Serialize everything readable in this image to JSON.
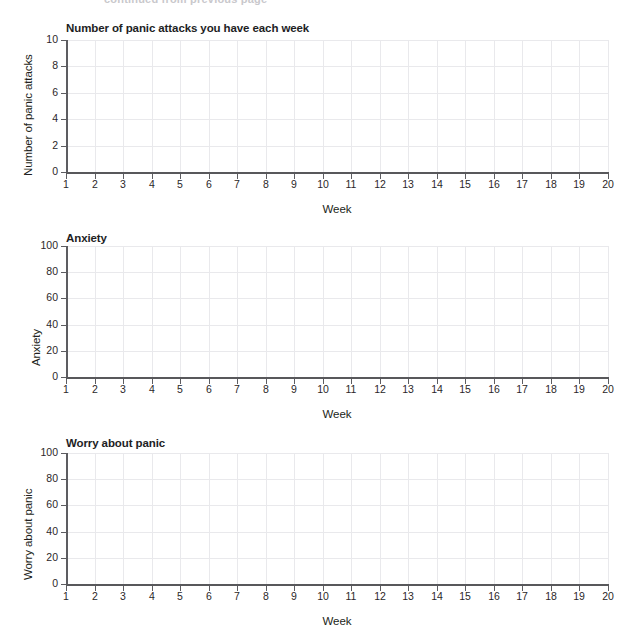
{
  "page": {
    "clipped_header_text": "continued from previous page"
  },
  "charts": [
    {
      "title": "Number of panic attacks you have each week",
      "ylabel": "Number of panic attacks",
      "xlabel": "Week",
      "yticks": [
        "0",
        "2",
        "4",
        "6",
        "8",
        "10"
      ],
      "xticks": [
        "1",
        "2",
        "3",
        "4",
        "5",
        "6",
        "7",
        "8",
        "9",
        "10",
        "11",
        "12",
        "13",
        "14",
        "15",
        "16",
        "17",
        "18",
        "19",
        "20"
      ]
    },
    {
      "title": "Anxiety",
      "ylabel": "Anxiety",
      "xlabel": "Week",
      "yticks": [
        "0",
        "20",
        "40",
        "60",
        "80",
        "100"
      ],
      "xticks": [
        "1",
        "2",
        "3",
        "4",
        "5",
        "6",
        "7",
        "8",
        "9",
        "10",
        "11",
        "12",
        "13",
        "14",
        "15",
        "16",
        "17",
        "18",
        "19",
        "20"
      ]
    },
    {
      "title": "Worry about panic",
      "ylabel": "Worry about panic",
      "xlabel": "Week",
      "yticks": [
        "0",
        "20",
        "40",
        "60",
        "80",
        "100"
      ],
      "xticks": [
        "1",
        "2",
        "3",
        "4",
        "5",
        "6",
        "7",
        "8",
        "9",
        "10",
        "11",
        "12",
        "13",
        "14",
        "15",
        "16",
        "17",
        "18",
        "19",
        "20"
      ]
    }
  ],
  "chart_data": [
    {
      "type": "line",
      "title": "Number of panic attacks you have each week",
      "xlabel": "Week",
      "ylabel": "Number of panic attacks",
      "x": [
        1,
        2,
        3,
        4,
        5,
        6,
        7,
        8,
        9,
        10,
        11,
        12,
        13,
        14,
        15,
        16,
        17,
        18,
        19,
        20
      ],
      "xticklabels": [
        "1",
        "2",
        "3",
        "4",
        "5",
        "6",
        "7",
        "8",
        "9",
        "10",
        "11",
        "12",
        "13",
        "14",
        "15",
        "16",
        "17",
        "18",
        "19",
        "20"
      ],
      "yticks": [
        0,
        2,
        4,
        6,
        8,
        10
      ],
      "yticklabels": [
        "0",
        "2",
        "4",
        "6",
        "8",
        "10"
      ],
      "xlim": [
        1,
        20
      ],
      "ylim": [
        0,
        10
      ],
      "grid": true,
      "legend": "none",
      "series": [],
      "values": [],
      "annotations": [
        "blank worksheet graph - no data plotted"
      ]
    },
    {
      "type": "line",
      "title": "Anxiety",
      "xlabel": "Week",
      "ylabel": "Anxiety",
      "x": [
        1,
        2,
        3,
        4,
        5,
        6,
        7,
        8,
        9,
        10,
        11,
        12,
        13,
        14,
        15,
        16,
        17,
        18,
        19,
        20
      ],
      "xticklabels": [
        "1",
        "2",
        "3",
        "4",
        "5",
        "6",
        "7",
        "8",
        "9",
        "10",
        "11",
        "12",
        "13",
        "14",
        "15",
        "16",
        "17",
        "18",
        "19",
        "20"
      ],
      "yticks": [
        0,
        20,
        40,
        60,
        80,
        100
      ],
      "yticklabels": [
        "0",
        "20",
        "40",
        "60",
        "80",
        "100"
      ],
      "xlim": [
        1,
        20
      ],
      "ylim": [
        0,
        100
      ],
      "grid": true,
      "legend": "none",
      "series": [],
      "values": [],
      "annotations": [
        "blank worksheet graph - no data plotted"
      ]
    },
    {
      "type": "line",
      "title": "Worry about panic",
      "xlabel": "Week",
      "ylabel": "Worry about panic",
      "x": [
        1,
        2,
        3,
        4,
        5,
        6,
        7,
        8,
        9,
        10,
        11,
        12,
        13,
        14,
        15,
        16,
        17,
        18,
        19,
        20
      ],
      "xticklabels": [
        "1",
        "2",
        "3",
        "4",
        "5",
        "6",
        "7",
        "8",
        "9",
        "10",
        "11",
        "12",
        "13",
        "14",
        "15",
        "16",
        "17",
        "18",
        "19",
        "20"
      ],
      "yticks": [
        0,
        20,
        40,
        60,
        80,
        100
      ],
      "yticklabels": [
        "0",
        "20",
        "40",
        "60",
        "80",
        "100"
      ],
      "xlim": [
        1,
        100
      ],
      "ylim": [
        0,
        100
      ],
      "grid": true,
      "legend": "none",
      "series": [],
      "values": [],
      "annotations": [
        "blank worksheet graph - no data plotted"
      ]
    }
  ]
}
